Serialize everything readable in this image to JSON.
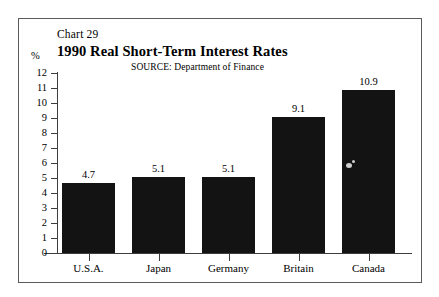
{
  "figure": {
    "chart_number": "Chart 29",
    "title": "1990 Real Short-Term Interest Rates",
    "unit_label": "%",
    "source": "SOURCE:  Department of Finance"
  },
  "colors": {
    "bar": "#131313",
    "axis": "#3d3d3d",
    "frame": "#5a5a5a",
    "background": "#ffffff"
  },
  "chart_data": {
    "type": "bar",
    "title": "1990 Real Short-Term Interest Rates",
    "subtitle": "Chart 29",
    "annotations": [
      "SOURCE:  Department of Finance"
    ],
    "xlabel": "",
    "ylabel": "%",
    "categories": [
      "U.S.A.",
      "Japan",
      "Germany",
      "Britain",
      "Canada"
    ],
    "values": [
      4.7,
      5.1,
      5.1,
      9.1,
      10.9
    ],
    "value_labels": [
      "4.7",
      "5.1",
      "5.1",
      "9.1",
      "10.9"
    ],
    "ylim": [
      0,
      12
    ],
    "yticks": [
      0,
      1,
      2,
      3,
      4,
      5,
      6,
      7,
      8,
      9,
      10,
      11,
      12
    ],
    "ytick_labels": [
      "0",
      "1",
      "2",
      "3",
      "4",
      "5",
      "6",
      "7",
      "8",
      "9",
      "10",
      "11",
      "12"
    ],
    "grid": false,
    "legend": "none"
  }
}
